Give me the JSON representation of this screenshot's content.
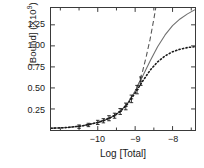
{
  "chart_data": {
    "type": "line",
    "title": "",
    "xlabel": "Log  [Total]",
    "ylabel": "[Bound]  (X10",
    "ylabel_exponent": "9",
    "xlim": [
      -11.25,
      -7.4
    ],
    "ylim": [
      0.0,
      1.45
    ],
    "grid": false,
    "legend_position": "none",
    "xticks": [
      -10,
      -9,
      -8
    ],
    "xtick_labels": [
      "−10",
      "−9",
      "−8"
    ],
    "xticks_minor": [
      -11,
      -10.5,
      -9.5,
      -8.5,
      -7.5
    ],
    "yticks": [
      0.25,
      0.5,
      0.75,
      1.0,
      1.25
    ],
    "ytick_labels": [
      "0.25",
      "0.50",
      "0.75",
      "1.00",
      "1.25"
    ],
    "series": [
      {
        "name": "dashed-model",
        "style": "dashed",
        "color": "#555555",
        "x": [
          -11.25,
          -10.8,
          -10.4,
          -10.0,
          -9.8,
          -9.6,
          -9.4,
          -9.2,
          -9.0,
          -8.9,
          -8.8,
          -8.7,
          -8.6,
          -8.5,
          -8.45
        ],
        "values": [
          0.02,
          0.03,
          0.05,
          0.09,
          0.12,
          0.16,
          0.22,
          0.32,
          0.46,
          0.56,
          0.7,
          0.88,
          1.08,
          1.32,
          1.45
        ]
      },
      {
        "name": "solid-model",
        "style": "solid",
        "color": "#707070",
        "x": [
          -11.25,
          -10.8,
          -10.4,
          -10.0,
          -9.8,
          -9.6,
          -9.4,
          -9.2,
          -9.0,
          -8.8,
          -8.6,
          -8.4,
          -8.2,
          -8.0,
          -7.8,
          -7.6,
          -7.4
        ],
        "values": [
          0.02,
          0.03,
          0.05,
          0.09,
          0.12,
          0.16,
          0.22,
          0.32,
          0.46,
          0.64,
          0.82,
          0.99,
          1.13,
          1.24,
          1.32,
          1.38,
          1.43
        ]
      },
      {
        "name": "dotted-model",
        "style": "dotted",
        "color": "#1a1a1a",
        "x": [
          -11.25,
          -10.8,
          -10.4,
          -10.0,
          -9.8,
          -9.6,
          -9.4,
          -9.2,
          -9.0,
          -8.8,
          -8.6,
          -8.4,
          -8.2,
          -8.0,
          -7.8,
          -7.6,
          -7.4
        ],
        "values": [
          0.02,
          0.03,
          0.05,
          0.09,
          0.12,
          0.16,
          0.22,
          0.31,
          0.44,
          0.58,
          0.71,
          0.81,
          0.88,
          0.93,
          0.96,
          0.98,
          0.99
        ]
      }
    ],
    "data_points": {
      "name": "measured-points",
      "marker": "error-bar",
      "x": [
        -10.5,
        -10.25,
        -10.0,
        -9.85,
        -9.7,
        -9.55,
        -9.4,
        -9.25,
        -9.1,
        -8.95,
        -8.85
      ],
      "values": [
        0.04,
        0.06,
        0.09,
        0.11,
        0.14,
        0.17,
        0.22,
        0.28,
        0.37,
        0.48,
        0.58
      ],
      "yerr": [
        0.02,
        0.02,
        0.025,
        0.025,
        0.03,
        0.03,
        0.035,
        0.04,
        0.045,
        0.05,
        0.05
      ]
    }
  }
}
